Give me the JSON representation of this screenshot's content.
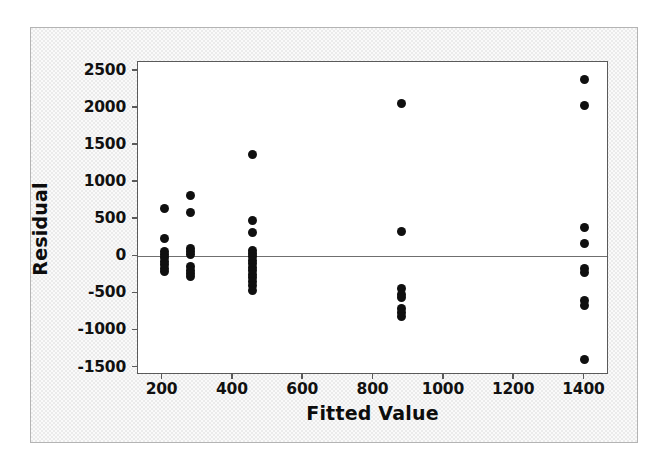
{
  "chart_data": {
    "type": "scatter",
    "title": "",
    "subtitle": "",
    "xlabel": "Fitted Value",
    "ylabel": "Residual",
    "xlim": [
      130,
      1470
    ],
    "ylim": [
      -1600,
      2620
    ],
    "xticks": [
      200,
      400,
      600,
      800,
      1000,
      1200,
      1400
    ],
    "xtick_labels": [
      "200",
      "400",
      "600",
      "800",
      "1000",
      "1200",
      "1400"
    ],
    "yticks": [
      2500,
      2000,
      1500,
      1000,
      500,
      0,
      -500,
      -1000,
      -1500
    ],
    "ytick_labels": [
      "2500",
      "2000",
      "1500",
      "1000",
      "500",
      "0",
      "-500",
      "-1000",
      "-1500"
    ],
    "grid": false,
    "legend": "none",
    "reference_line": {
      "axis": "y",
      "value": 0,
      "color": "#6f6f6f"
    },
    "marker": {
      "shape": "circle",
      "color": "#101010",
      "size": 9
    },
    "points": [
      {
        "x": 205,
        "y": 640
      },
      {
        "x": 205,
        "y": 235
      },
      {
        "x": 205,
        "y": 60
      },
      {
        "x": 205,
        "y": 20
      },
      {
        "x": 205,
        "y": -20
      },
      {
        "x": 205,
        "y": -70
      },
      {
        "x": 205,
        "y": -115
      },
      {
        "x": 205,
        "y": -165
      },
      {
        "x": 205,
        "y": -200
      },
      {
        "x": 280,
        "y": 820
      },
      {
        "x": 280,
        "y": 590
      },
      {
        "x": 280,
        "y": 110
      },
      {
        "x": 280,
        "y": 65
      },
      {
        "x": 280,
        "y": 20
      },
      {
        "x": 280,
        "y": -140
      },
      {
        "x": 280,
        "y": -185
      },
      {
        "x": 280,
        "y": -230
      },
      {
        "x": 280,
        "y": -275
      },
      {
        "x": 455,
        "y": 1375
      },
      {
        "x": 455,
        "y": 485
      },
      {
        "x": 455,
        "y": 315
      },
      {
        "x": 455,
        "y": 75
      },
      {
        "x": 455,
        "y": 35
      },
      {
        "x": 455,
        "y": -5
      },
      {
        "x": 455,
        "y": -55
      },
      {
        "x": 455,
        "y": -100
      },
      {
        "x": 455,
        "y": -145
      },
      {
        "x": 455,
        "y": -190
      },
      {
        "x": 455,
        "y": -240
      },
      {
        "x": 455,
        "y": -290
      },
      {
        "x": 455,
        "y": -340
      },
      {
        "x": 455,
        "y": -400
      },
      {
        "x": 455,
        "y": -455
      },
      {
        "x": 880,
        "y": 2060
      },
      {
        "x": 880,
        "y": 340
      },
      {
        "x": 880,
        "y": -440
      },
      {
        "x": 880,
        "y": -520
      },
      {
        "x": 880,
        "y": -560
      },
      {
        "x": 880,
        "y": -700
      },
      {
        "x": 880,
        "y": -760
      },
      {
        "x": 880,
        "y": -805
      },
      {
        "x": 1400,
        "y": 2390
      },
      {
        "x": 1400,
        "y": 2040
      },
      {
        "x": 1400,
        "y": 390
      },
      {
        "x": 1400,
        "y": 170
      },
      {
        "x": 1400,
        "y": -165
      },
      {
        "x": 1400,
        "y": -215
      },
      {
        "x": 1400,
        "y": -600
      },
      {
        "x": 1400,
        "y": -660
      },
      {
        "x": 1400,
        "y": -1385
      }
    ]
  },
  "figure": {
    "background_color": "#ffffff",
    "panel_color": "#ebebeb",
    "frame_color": "#5a5a5a",
    "axis_text_color": "#111111"
  }
}
